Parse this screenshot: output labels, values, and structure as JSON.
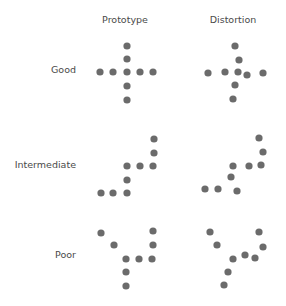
{
  "headers": [
    {
      "label": "Prototype",
      "cx": 125,
      "y": 14
    },
    {
      "label": "Distortion",
      "cx": 233,
      "y": 14
    }
  ],
  "rows": [
    {
      "label": "Good",
      "right": 76,
      "y": 64
    },
    {
      "label": "Intermediate",
      "right": 76,
      "y": 159
    },
    {
      "label": "Poor",
      "right": 76,
      "y": 249
    }
  ],
  "dot_style": {
    "color": "#6b6b6b",
    "radius": 3.6
  },
  "patterns": [
    {
      "row": "Good",
      "type": "Prototype",
      "points": [
        [
          127,
          46
        ],
        [
          127,
          59
        ],
        [
          100,
          72
        ],
        [
          113,
          72
        ],
        [
          127,
          72
        ],
        [
          140,
          72
        ],
        [
          153,
          72
        ],
        [
          127,
          86
        ],
        [
          127,
          100
        ]
      ]
    },
    {
      "row": "Good",
      "type": "Distortion",
      "points": [
        [
          235,
          46
        ],
        [
          239,
          60
        ],
        [
          208,
          73
        ],
        [
          225,
          72
        ],
        [
          238,
          72
        ],
        [
          247,
          75
        ],
        [
          263,
          73
        ],
        [
          235,
          85
        ],
        [
          233,
          99
        ]
      ]
    },
    {
      "row": "Intermediate",
      "type": "Prototype",
      "points": [
        [
          154,
          139
        ],
        [
          154,
          153
        ],
        [
          127,
          166
        ],
        [
          140,
          166
        ],
        [
          153,
          166
        ],
        [
          127,
          180
        ],
        [
          101,
          193
        ],
        [
          113,
          193
        ],
        [
          127,
          193
        ]
      ]
    },
    {
      "row": "Intermediate",
      "type": "Distortion",
      "points": [
        [
          259,
          138
        ],
        [
          263,
          152
        ],
        [
          233,
          166
        ],
        [
          249,
          166
        ],
        [
          261,
          165
        ],
        [
          231,
          177
        ],
        [
          205,
          189
        ],
        [
          218,
          189
        ],
        [
          237,
          191
        ]
      ]
    },
    {
      "row": "Poor",
      "type": "Prototype",
      "points": [
        [
          101,
          233
        ],
        [
          114,
          245
        ],
        [
          153,
          231
        ],
        [
          153,
          245
        ],
        [
          126,
          259
        ],
        [
          139,
          259
        ],
        [
          152,
          259
        ],
        [
          126,
          272
        ],
        [
          126,
          286
        ]
      ]
    },
    {
      "row": "Poor",
      "type": "Distortion",
      "points": [
        [
          210,
          232
        ],
        [
          217,
          245
        ],
        [
          259,
          232
        ],
        [
          263,
          247
        ],
        [
          233,
          259
        ],
        [
          245,
          255
        ],
        [
          255,
          258
        ],
        [
          228,
          272
        ],
        [
          224,
          285
        ]
      ]
    }
  ]
}
